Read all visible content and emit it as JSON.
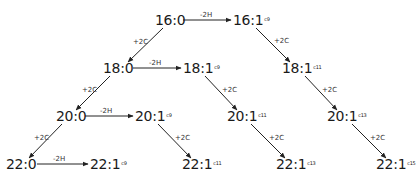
{
  "diagram": {
    "title": "",
    "colors": {
      "line": "#222222",
      "text": "#1a1a1a"
    },
    "nodes": [
      {
        "id": "n16_0",
        "base": "16:0",
        "sup": "",
        "x": 155,
        "y": 12
      },
      {
        "id": "n16_1c9",
        "base": "16:1",
        "sup": "c9",
        "x": 233,
        "y": 12
      },
      {
        "id": "n18_0",
        "base": "18:0",
        "sup": "",
        "x": 103,
        "y": 60
      },
      {
        "id": "n18_1c9",
        "base": "18:1",
        "sup": "c9",
        "x": 183,
        "y": 60
      },
      {
        "id": "n18_1c11",
        "base": "18:1",
        "sup": "c11",
        "x": 282,
        "y": 60
      },
      {
        "id": "n20_0",
        "base": "20:0",
        "sup": "",
        "x": 56,
        "y": 108
      },
      {
        "id": "n20_1c9",
        "base": "20:1",
        "sup": "c9",
        "x": 135,
        "y": 108
      },
      {
        "id": "n20_1c11",
        "base": "20:1",
        "sup": "c11",
        "x": 227,
        "y": 108
      },
      {
        "id": "n20_1c13",
        "base": "20:1",
        "sup": "c13",
        "x": 327,
        "y": 108
      },
      {
        "id": "n22_0",
        "base": "22:0",
        "sup": "",
        "x": 6,
        "y": 156
      },
      {
        "id": "n22_1c9",
        "base": "22:1",
        "sup": "c9",
        "x": 90,
        "y": 156
      },
      {
        "id": "n22_1c11",
        "base": "22:1",
        "sup": "c11",
        "x": 182,
        "y": 156
      },
      {
        "id": "n22_1c13",
        "base": "22:1",
        "sup": "c13",
        "x": 276,
        "y": 156
      },
      {
        "id": "n22_1c15",
        "base": "22:1",
        "sup": "c15",
        "x": 376,
        "y": 156
      }
    ],
    "edges": [
      {
        "from": "16:0",
        "to": "16:1c9",
        "label": "-2H",
        "x1": 183,
        "y1": 20,
        "x2": 231,
        "y2": 20,
        "lx": 200,
        "ly": 11
      },
      {
        "from": "18:0",
        "to": "18:1c9",
        "label": "-2H",
        "x1": 133,
        "y1": 68,
        "x2": 181,
        "y2": 68,
        "lx": 149,
        "ly": 59
      },
      {
        "from": "20:0",
        "to": "20:1c9",
        "label": "-2H",
        "x1": 85,
        "y1": 116,
        "x2": 133,
        "y2": 116,
        "lx": 100,
        "ly": 107
      },
      {
        "from": "22:0",
        "to": "22:1c9",
        "label": "-2H",
        "x1": 37,
        "y1": 164,
        "x2": 88,
        "y2": 164,
        "lx": 53,
        "ly": 155
      },
      {
        "from": "16:0",
        "to": "18:0",
        "label": "+2C",
        "x1": 163,
        "y1": 28,
        "x2": 128,
        "y2": 62,
        "lx": 133,
        "ly": 38
      },
      {
        "from": "18:0",
        "to": "20:0",
        "label": "+2C",
        "x1": 110,
        "y1": 76,
        "x2": 76,
        "y2": 110,
        "lx": 82,
        "ly": 86
      },
      {
        "from": "20:0",
        "to": "22:0",
        "label": "+2C",
        "x1": 62,
        "y1": 124,
        "x2": 29,
        "y2": 158,
        "lx": 34,
        "ly": 134
      },
      {
        "from": "16:1c9",
        "to": "18:1c11",
        "label": "+2C",
        "x1": 256,
        "y1": 28,
        "x2": 290,
        "y2": 62,
        "lx": 274,
        "ly": 37
      },
      {
        "from": "18:1c9",
        "to": "20:1c11",
        "label": "+2C",
        "x1": 205,
        "y1": 76,
        "x2": 237,
        "y2": 110,
        "lx": 222,
        "ly": 86
      },
      {
        "from": "18:1c11",
        "to": "20:1c13",
        "label": "+2C",
        "x1": 305,
        "y1": 76,
        "x2": 337,
        "y2": 110,
        "lx": 322,
        "ly": 86
      },
      {
        "from": "20:1c9",
        "to": "22:1c11",
        "label": "+2C",
        "x1": 158,
        "y1": 124,
        "x2": 191,
        "y2": 158,
        "lx": 175,
        "ly": 134
      },
      {
        "from": "20:1c11",
        "to": "22:1c13",
        "label": "+2C",
        "x1": 251,
        "y1": 124,
        "x2": 285,
        "y2": 158,
        "lx": 269,
        "ly": 134
      },
      {
        "from": "20:1c13",
        "to": "22:1c15",
        "label": "+2C",
        "x1": 352,
        "y1": 124,
        "x2": 386,
        "y2": 158,
        "lx": 370,
        "ly": 134
      }
    ]
  }
}
